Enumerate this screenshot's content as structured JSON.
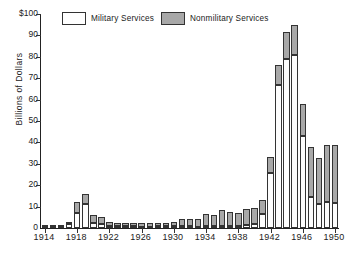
{
  "chart_data": {
    "type": "bar",
    "stacked": true,
    "title": "",
    "subtitle": "",
    "xlabel": "",
    "ylabel": "Billions of Dollars",
    "ylim": [
      0,
      100
    ],
    "ytick_labels": [
      "$100",
      "90",
      "80",
      "70",
      "60",
      "50",
      "40",
      "30",
      "20",
      "10",
      "0"
    ],
    "ytick_values": [
      100,
      90,
      80,
      70,
      60,
      50,
      40,
      30,
      20,
      10,
      0
    ],
    "xtick_labels": [
      "1914",
      "1918",
      "1922",
      "1926",
      "1930",
      "1934",
      "1938",
      "1942",
      "1946",
      "1950"
    ],
    "xtick_values": [
      1914,
      1918,
      1922,
      1926,
      1930,
      1934,
      1938,
      1942,
      1946,
      1950
    ],
    "grid": false,
    "legend_position": "top",
    "categories": [
      1914,
      1915,
      1916,
      1917,
      1918,
      1919,
      1920,
      1921,
      1922,
      1923,
      1924,
      1925,
      1926,
      1927,
      1928,
      1929,
      1930,
      1931,
      1932,
      1933,
      1934,
      1935,
      1936,
      1937,
      1938,
      1939,
      1940,
      1941,
      1942,
      1943,
      1944,
      1945,
      1946,
      1947,
      1948,
      1949,
      1950
    ],
    "series": [
      {
        "name": "Military Services",
        "color": "#ffffff",
        "values": [
          0.3,
          0.3,
          0.4,
          1.7,
          7.0,
          11.0,
          2.4,
          2.0,
          1.0,
          0.8,
          0.8,
          0.8,
          0.7,
          0.7,
          0.8,
          0.8,
          0.8,
          0.8,
          0.8,
          0.7,
          0.8,
          0.9,
          1.0,
          1.0,
          1.1,
          1.3,
          1.8,
          6.4,
          25.7,
          66.7,
          79.1,
          81.0,
          43.2,
          14.4,
          11.0,
          12.0,
          11.8
        ]
      },
      {
        "name": "Nonmilitary Services",
        "color": "#a8a8a8",
        "values": [
          0.4,
          0.4,
          0.8,
          0.4,
          5.2,
          5.0,
          3.5,
          3.0,
          2.0,
          1.6,
          1.7,
          1.7,
          1.7,
          1.7,
          1.7,
          1.7,
          2.0,
          3.4,
          3.5,
          3.3,
          5.6,
          5.4,
          7.5,
          6.4,
          5.9,
          7.5,
          7.4,
          6.5,
          7.4,
          9.4,
          12.3,
          13.9,
          14.7,
          23.3,
          21.6,
          26.6,
          26.9
        ]
      }
    ],
    "totals": [
      0.7,
      0.7,
      1.2,
      2.1,
      12.2,
      16.0,
      5.9,
      5.0,
      3.0,
      2.4,
      2.5,
      2.5,
      2.4,
      2.4,
      2.5,
      2.5,
      2.8,
      4.2,
      4.3,
      4.0,
      6.4,
      6.3,
      8.5,
      7.4,
      7.0,
      8.8,
      9.2,
      12.9,
      33.1,
      76.1,
      91.4,
      94.9,
      57.9,
      37.7,
      32.6,
      38.6,
      38.7
    ]
  },
  "legend": {
    "items": [
      {
        "label": "Military Services",
        "swatch": "white"
      },
      {
        "label": "Nonmilitary Services",
        "swatch": "gray"
      }
    ]
  },
  "axis": {
    "y_title": "Billions of Dollars"
  }
}
